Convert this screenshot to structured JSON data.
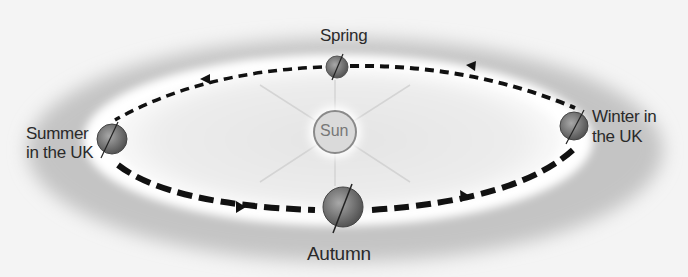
{
  "diagram": {
    "sun": {
      "label": "Sun"
    },
    "positions": [
      {
        "id": "spring",
        "label": "Spring"
      },
      {
        "id": "summer",
        "label_line1": "Summer",
        "label_line2": "in the UK"
      },
      {
        "id": "autumn",
        "label": "Autumn"
      },
      {
        "id": "winter",
        "label_line1": "Winter in",
        "label_line2": "the UK"
      }
    ],
    "orbit_direction": "anticlockwise",
    "colors": {
      "background": "#f4f4f4",
      "outer_halo": "#c9c9c9",
      "inner_glow": "#ffffff",
      "orbit_dash": "#111111",
      "sun_fill": "#d8d8d8",
      "sun_ring": "#8a8a8a",
      "earth_fill": "#7a7a7a"
    }
  }
}
